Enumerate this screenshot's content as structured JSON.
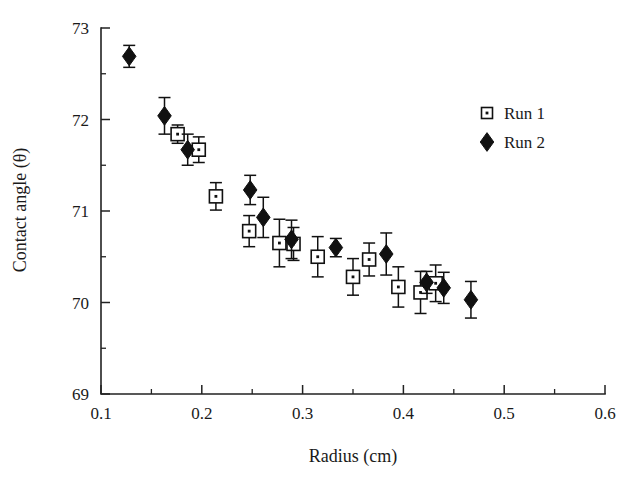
{
  "chart_data": {
    "type": "scatter",
    "title": "",
    "xlabel": "Radius (cm)",
    "ylabel": "Contact angle (θ)",
    "xlim": [
      0.1,
      0.6
    ],
    "ylim": [
      69,
      73
    ],
    "xticks": [
      "0.1",
      "0.2",
      "0.3",
      "0.4",
      "0.5",
      "0.6"
    ],
    "xtick_values": [
      0.1,
      0.2,
      0.3,
      0.4,
      0.5,
      0.6
    ],
    "xminor_values": [
      0.15,
      0.25,
      0.35,
      0.45,
      0.55
    ],
    "yticks": [
      "69",
      "70",
      "71",
      "72",
      "73"
    ],
    "ytick_values": [
      69,
      70,
      71,
      72,
      73
    ],
    "yminor_values": [
      69.5,
      70.5,
      71.5,
      72.5
    ],
    "grid": false,
    "legend_position": "upper-right",
    "error_bars": "symmetric-y",
    "series": [
      {
        "name": "Run 1",
        "marker": "open-square",
        "points": [
          {
            "x": 0.176,
            "y": 71.84,
            "yerr": 0.1
          },
          {
            "x": 0.197,
            "y": 71.67,
            "yerr": 0.14
          },
          {
            "x": 0.214,
            "y": 71.16,
            "yerr": 0.15
          },
          {
            "x": 0.247,
            "y": 70.78,
            "yerr": 0.17
          },
          {
            "x": 0.277,
            "y": 70.65,
            "yerr": 0.26
          },
          {
            "x": 0.291,
            "y": 70.64,
            "yerr": 0.18
          },
          {
            "x": 0.315,
            "y": 70.5,
            "yerr": 0.22
          },
          {
            "x": 0.35,
            "y": 70.28,
            "yerr": 0.2
          },
          {
            "x": 0.366,
            "y": 70.47,
            "yerr": 0.18
          },
          {
            "x": 0.395,
            "y": 70.17,
            "yerr": 0.22
          },
          {
            "x": 0.417,
            "y": 70.11,
            "yerr": 0.23
          },
          {
            "x": 0.432,
            "y": 70.21,
            "yerr": 0.2
          }
        ]
      },
      {
        "name": "Run 2",
        "marker": "filled-diamond",
        "points": [
          {
            "x": 0.128,
            "y": 72.69,
            "yerr": 0.12
          },
          {
            "x": 0.163,
            "y": 72.04,
            "yerr": 0.2
          },
          {
            "x": 0.186,
            "y": 71.67,
            "yerr": 0.17
          },
          {
            "x": 0.248,
            "y": 71.23,
            "yerr": 0.16
          },
          {
            "x": 0.261,
            "y": 70.93,
            "yerr": 0.22
          },
          {
            "x": 0.289,
            "y": 70.69,
            "yerr": 0.21
          },
          {
            "x": 0.333,
            "y": 70.6,
            "yerr": 0.1
          },
          {
            "x": 0.383,
            "y": 70.53,
            "yerr": 0.23
          },
          {
            "x": 0.423,
            "y": 70.22,
            "yerr": 0.12
          },
          {
            "x": 0.44,
            "y": 70.16,
            "yerr": 0.17
          },
          {
            "x": 0.467,
            "y": 70.03,
            "yerr": 0.2
          }
        ]
      }
    ],
    "legend": [
      {
        "label": "Run 1",
        "marker": "open-square"
      },
      {
        "label": "Run 2",
        "marker": "filled-diamond"
      }
    ]
  }
}
